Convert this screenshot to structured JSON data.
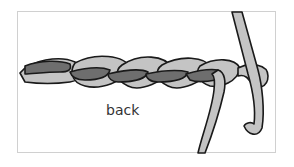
{
  "diagram": {
    "label": "back",
    "colors": {
      "light_yarn": "#c4c4c4",
      "dark_yarn": "#6e6e6e",
      "outline": "#1a1a1a",
      "frame": "#d0d0d0"
    }
  }
}
